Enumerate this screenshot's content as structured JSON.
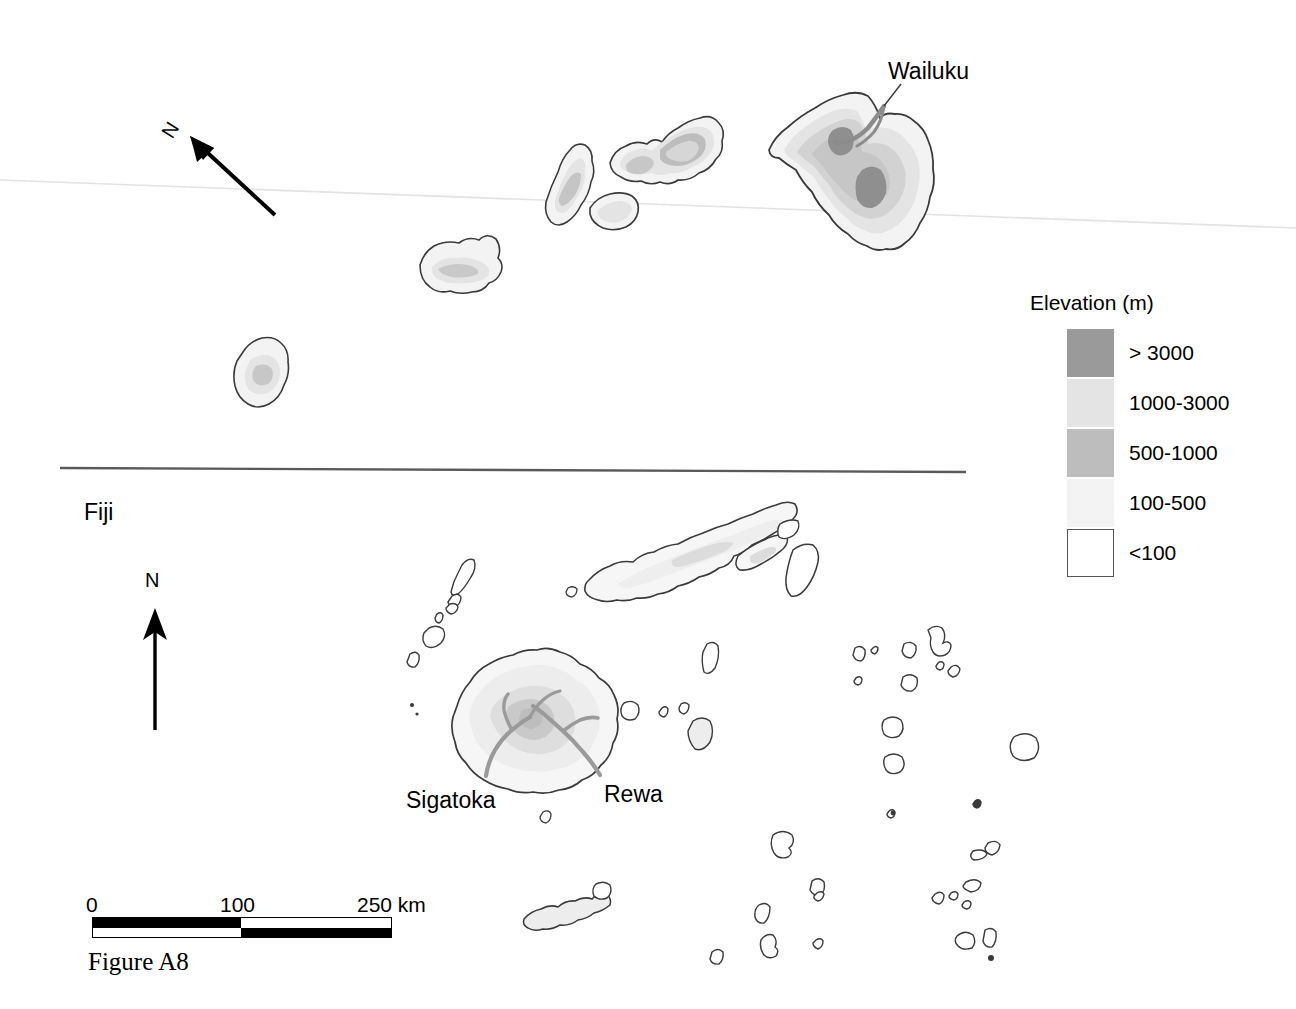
{
  "figure": {
    "caption": "Figure A8"
  },
  "panels": {
    "hawaii": {
      "name": "Hawaiian Islands",
      "place_labels": [
        {
          "text": "Wailuku",
          "x": 888,
          "y": 60
        }
      ],
      "north_arrow": {
        "letter": "N",
        "rotation_deg": -58
      }
    },
    "fiji": {
      "title": "Fiji",
      "place_labels": [
        {
          "text": "Sigatoka",
          "x": 406,
          "y": 789
        },
        {
          "text": "Rewa",
          "x": 604,
          "y": 783
        }
      ],
      "north_arrow": {
        "letter": "N",
        "rotation_deg": 0
      }
    }
  },
  "legend": {
    "title": "Elevation (m)",
    "entries": [
      {
        "label": "> 3000",
        "color": "#9a9a9a",
        "bordered": false
      },
      {
        "label": "1000-3000",
        "color": "#e4e4e4",
        "bordered": false
      },
      {
        "label": "500-1000",
        "color": "#bdbdbd",
        "bordered": false
      },
      {
        "label": "100-500",
        "color": "#f3f3f3",
        "bordered": false
      },
      {
        "label": "<100",
        "color": "#ffffff",
        "bordered": true
      }
    ]
  },
  "scalebar": {
    "ticks": [
      "0",
      "100",
      "250 km"
    ],
    "unit": "km",
    "max_value": 250,
    "break_value": 100
  },
  "colors": {
    "coastline": "#3a3a3a",
    "river": "#8c8c8c",
    "divider": "#5a5a5a",
    "elev_gt3000": "#9a9a9a",
    "elev_1000_3000": "#e4e4e4",
    "elev_500_1000": "#bdbdbd",
    "elev_100_500": "#f3f3f3",
    "elev_lt100": "#ffffff",
    "background": "#ffffff"
  }
}
